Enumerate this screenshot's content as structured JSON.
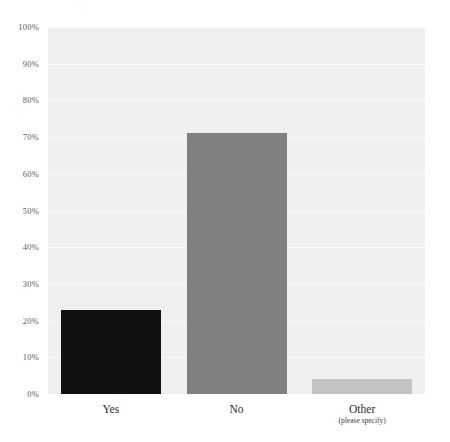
{
  "chart_data": {
    "type": "bar",
    "title": "",
    "subtitle": "",
    "xlabel": "",
    "ylabel": "",
    "categories": [
      "Yes",
      "No",
      "Other"
    ],
    "category_sublabels": [
      "",
      "",
      "(please specify)"
    ],
    "values": [
      23,
      71,
      4
    ],
    "value_labels": [
      "23%",
      "71%",
      "4%"
    ],
    "bar_colors": [
      "#111111",
      "#808080",
      "#c3c3c3"
    ],
    "ylim": [
      0,
      100
    ],
    "ytick_labels": [
      "0%",
      "10%",
      "20%",
      "30%",
      "40%",
      "50%",
      "60%",
      "70%",
      "80%",
      "90%",
      "100%"
    ],
    "ytick_values": [
      0,
      10,
      20,
      30,
      40,
      50,
      60,
      70,
      80,
      90,
      100
    ],
    "grid": true,
    "grid_color": "#fafafa",
    "plot_background": "#f0f0f0",
    "page_background": "#ffffff",
    "legend": false,
    "legend_position": "none",
    "annotations": []
  },
  "axis": {
    "y_tick_color": "#5a5a5a",
    "x_label_color": "#2b2b2b"
  }
}
